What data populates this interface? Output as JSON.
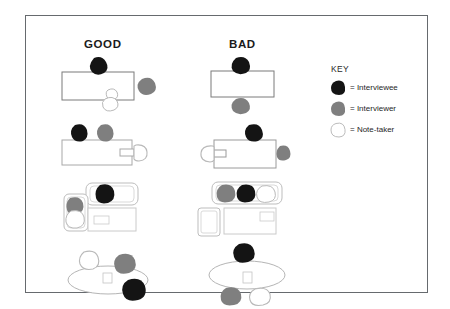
{
  "figure": {
    "columns": [
      {
        "id": "good",
        "label": "GOOD"
      },
      {
        "id": "bad",
        "label": "BAD"
      }
    ],
    "key": {
      "title": "KEY",
      "items": [
        {
          "icon": "black-blob-icon",
          "swatch_color": "#141414",
          "label": "= Interviewee"
        },
        {
          "icon": "gray-blob-icon",
          "swatch_color": "#7f7f7f",
          "label": "= Interviewer"
        },
        {
          "icon": "white-blob-icon",
          "swatch_color": "#ffffff",
          "label": "= Note-taker"
        }
      ]
    },
    "colors": {
      "interviewee": "#141414",
      "interviewer": "#7f7f7f",
      "note_taker_fill": "#ffffff",
      "note_taker_stroke": "#b9b9b9",
      "furniture_stroke": "#9a9a9a",
      "table_stroke_dark": "#7b7b7b",
      "panel_border": "#666a6e",
      "background": "#ffffff",
      "text": "#1b1b1b"
    },
    "rows": [
      {
        "row": 1,
        "good": {
          "caption": "Rectangular table, interviewee at head, interviewer to the side, note-taker off-centre",
          "furniture": "rectangular-table"
        },
        "bad": {
          "caption": "Rectangular table, interviewee and interviewer directly opposite across table",
          "furniture": "rectangular-table"
        }
      },
      {
        "row": 2,
        "good": {
          "caption": "Long table, interviewee and interviewer side by side, note-taker at far end",
          "furniture": "long-table"
        },
        "bad": {
          "caption": "Long table, note-taker at far end blocking, interviewer at opposite end",
          "furniture": "long-table"
        }
      },
      {
        "row": 3,
        "good": {
          "caption": "Sofa with interviewee, armchair with interviewer and note-taker, coffee table",
          "furniture": "sofa-and-armchair"
        },
        "bad": {
          "caption": "All three seated in a row on one sofa, empty armchair, coffee table",
          "furniture": "sofa-and-armchair"
        }
      },
      {
        "row": 4,
        "good": {
          "caption": "Oval table, participants spaced around the table",
          "furniture": "oval-table"
        },
        "bad": {
          "caption": "Oval table, interviewee alone on one side facing two on the other",
          "furniture": "oval-table"
        }
      }
    ]
  }
}
